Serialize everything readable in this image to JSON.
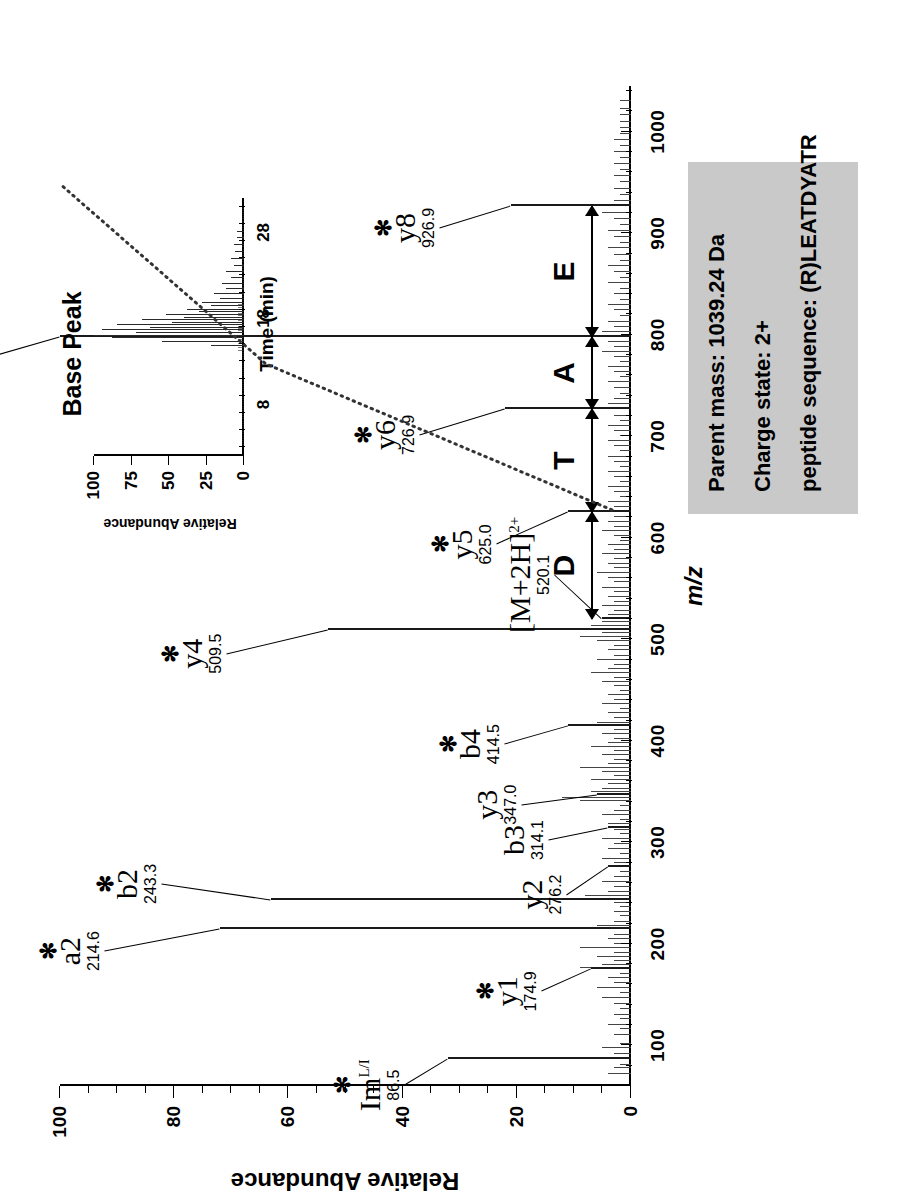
{
  "figure": {
    "info_box": {
      "parent_mass": "Parent mass: 1039.24 Da",
      "charge_state": "Charge state: 2+",
      "peptide_sequence": "peptide sequence: (R)LEATDYATR"
    },
    "inset_title": "Base Peak"
  },
  "chart_data": [
    {
      "type": "bar",
      "id": "ms-ms-spectrum",
      "title": "",
      "xlabel": "m/z",
      "ylabel": "Relative Abundance",
      "xlim": [
        60,
        1045
      ],
      "ylim": [
        0,
        100
      ],
      "grid": false,
      "legend": "none",
      "xticks": [
        100,
        200,
        300,
        400,
        500,
        600,
        700,
        800,
        900,
        1000
      ],
      "yticks": [
        0,
        20,
        40,
        60,
        80,
        100
      ],
      "x_minor_step": 20,
      "y_minor_step": 5,
      "annotated_peaks": [
        {
          "label": "Im",
          "sup": "L/I",
          "mz": "86.5",
          "x": 86.5,
          "y": 32,
          "star": true
        },
        {
          "label": "y1",
          "sup": "",
          "mz": "174.9",
          "x": 174.9,
          "y": 7,
          "star": true
        },
        {
          "label": "a2",
          "sup": "",
          "mz": "214.6",
          "x": 214.6,
          "y": 72,
          "star": true
        },
        {
          "label": "b2",
          "sup": "",
          "mz": "243.3",
          "x": 243.3,
          "y": 63,
          "star": true
        },
        {
          "label": "y2",
          "sup": "",
          "mz": "276.2",
          "x": 276.2,
          "y": 4,
          "star": false
        },
        {
          "label": "b3",
          "sup": "",
          "mz": "314.1",
          "x": 314.1,
          "y": 4,
          "star": false
        },
        {
          "label": "y3",
          "sup": "",
          "mz": "347.0",
          "x": 347.0,
          "y": 6,
          "star": false
        },
        {
          "label": "b4",
          "sup": "",
          "mz": "414.5",
          "x": 414.5,
          "y": 11,
          "star": true
        },
        {
          "label": "y4",
          "sup": "",
          "mz": "509.5",
          "x": 509.5,
          "y": 53,
          "star": true
        },
        {
          "label": "[M+2H]",
          "sup": "2+",
          "mz": "520.1",
          "x": 520.1,
          "y": 5,
          "star": false
        },
        {
          "label": "y5",
          "sup": "",
          "mz": "625.0",
          "x": 625.0,
          "y": 11,
          "star": true
        },
        {
          "label": "y6",
          "sup": "",
          "mz": "726.9",
          "x": 726.9,
          "y": 22,
          "star": true
        },
        {
          "label": "y7",
          "sup": "",
          "mz": "797.8",
          "x": 797.8,
          "y": 100,
          "star": true
        },
        {
          "label": "y8",
          "sup": "",
          "mz": "926.9",
          "x": 926.9,
          "y": 21,
          "star": true
        }
      ],
      "sequence_ladder": [
        {
          "residue": "D",
          "from_mz": 520.1,
          "to_mz": 625.0
        },
        {
          "residue": "T",
          "from_mz": 625.0,
          "to_mz": 726.9
        },
        {
          "residue": "A",
          "from_mz": 726.9,
          "to_mz": 797.8
        },
        {
          "residue": "E",
          "from_mz": 797.8,
          "to_mz": 926.9
        }
      ],
      "background_peaks": [
        [
          72,
          4
        ],
        [
          78,
          3
        ],
        [
          81,
          2
        ],
        [
          92,
          3
        ],
        [
          97,
          5
        ],
        [
          101,
          2
        ],
        [
          110,
          3
        ],
        [
          116,
          2
        ],
        [
          120,
          4
        ],
        [
          126,
          2
        ],
        [
          130,
          3
        ],
        [
          136,
          2
        ],
        [
          141,
          3
        ],
        [
          147,
          5
        ],
        [
          152,
          2
        ],
        [
          157,
          6
        ],
        [
          161,
          3
        ],
        [
          166,
          4
        ],
        [
          170,
          2
        ],
        [
          176,
          9
        ],
        [
          179,
          5
        ],
        [
          183,
          3
        ],
        [
          187,
          6
        ],
        [
          191,
          3
        ],
        [
          196,
          9
        ],
        [
          200,
          3
        ],
        [
          205,
          4
        ],
        [
          209,
          3
        ],
        [
          218,
          6
        ],
        [
          222,
          3
        ],
        [
          227,
          2
        ],
        [
          231,
          3
        ],
        [
          236,
          2
        ],
        [
          240,
          3
        ],
        [
          247,
          8
        ],
        [
          251,
          4
        ],
        [
          256,
          3
        ],
        [
          261,
          5
        ],
        [
          266,
          3
        ],
        [
          271,
          2
        ],
        [
          280,
          3
        ],
        [
          284,
          5
        ],
        [
          289,
          2
        ],
        [
          293,
          4
        ],
        [
          298,
          3
        ],
        [
          303,
          5
        ],
        [
          308,
          2
        ],
        [
          312,
          3
        ],
        [
          318,
          4
        ],
        [
          322,
          2
        ],
        [
          327,
          5
        ],
        [
          331,
          3
        ],
        [
          336,
          2
        ],
        [
          341,
          9
        ],
        [
          344,
          12
        ],
        [
          350,
          7
        ],
        [
          353,
          5
        ],
        [
          357,
          4
        ],
        [
          361,
          7
        ],
        [
          365,
          3
        ],
        [
          369,
          5
        ],
        [
          373,
          9
        ],
        [
          377,
          4
        ],
        [
          381,
          3
        ],
        [
          386,
          5
        ],
        [
          390,
          3
        ],
        [
          394,
          7
        ],
        [
          398,
          4
        ],
        [
          402,
          3
        ],
        [
          407,
          5
        ],
        [
          411,
          3
        ],
        [
          418,
          6
        ],
        [
          422,
          3
        ],
        [
          427,
          4
        ],
        [
          431,
          2
        ],
        [
          436,
          5
        ],
        [
          440,
          3
        ],
        [
          445,
          4
        ],
        [
          449,
          2
        ],
        [
          454,
          3
        ],
        [
          458,
          5
        ],
        [
          462,
          3
        ],
        [
          467,
          7
        ],
        [
          471,
          4
        ],
        [
          475,
          3
        ],
        [
          480,
          6
        ],
        [
          484,
          3
        ],
        [
          489,
          4
        ],
        [
          493,
          3
        ],
        [
          498,
          6
        ],
        [
          502,
          9
        ],
        [
          506,
          5
        ],
        [
          513,
          7
        ],
        [
          517,
          5
        ],
        [
          524,
          4
        ],
        [
          528,
          3
        ],
        [
          533,
          5
        ],
        [
          537,
          3
        ],
        [
          542,
          4
        ],
        [
          547,
          3
        ],
        [
          551,
          5
        ],
        [
          556,
          3
        ],
        [
          560,
          4
        ],
        [
          565,
          6
        ],
        [
          570,
          3
        ],
        [
          574,
          4
        ],
        [
          579,
          3
        ],
        [
          584,
          5
        ],
        [
          588,
          3
        ],
        [
          593,
          4
        ],
        [
          597,
          2
        ],
        [
          602,
          3
        ],
        [
          607,
          5
        ],
        [
          611,
          3
        ],
        [
          616,
          4
        ],
        [
          620,
          3
        ],
        [
          630,
          3
        ],
        [
          635,
          4
        ],
        [
          640,
          2
        ],
        [
          645,
          3
        ],
        [
          650,
          4
        ],
        [
          655,
          2
        ],
        [
          660,
          3
        ],
        [
          665,
          4
        ],
        [
          670,
          2
        ],
        [
          675,
          3
        ],
        [
          680,
          4
        ],
        [
          685,
          2
        ],
        [
          690,
          3
        ],
        [
          695,
          4
        ],
        [
          700,
          2
        ],
        [
          705,
          3
        ],
        [
          710,
          4
        ],
        [
          715,
          2
        ],
        [
          720,
          3
        ],
        [
          732,
          4
        ],
        [
          737,
          3
        ],
        [
          742,
          2
        ],
        [
          748,
          3
        ],
        [
          753,
          4
        ],
        [
          758,
          2
        ],
        [
          763,
          3
        ],
        [
          768,
          4
        ],
        [
          773,
          2
        ],
        [
          778,
          3
        ],
        [
          783,
          5
        ],
        [
          788,
          3
        ],
        [
          793,
          4
        ],
        [
          803,
          5
        ],
        [
          808,
          3
        ],
        [
          813,
          4
        ],
        [
          818,
          2
        ],
        [
          824,
          3
        ],
        [
          829,
          4
        ],
        [
          834,
          2
        ],
        [
          840,
          3
        ],
        [
          845,
          2
        ],
        [
          851,
          4
        ],
        [
          856,
          2
        ],
        [
          862,
          3
        ],
        [
          868,
          4
        ],
        [
          873,
          2
        ],
        [
          879,
          3
        ],
        [
          885,
          4
        ],
        [
          890,
          2
        ],
        [
          896,
          3
        ],
        [
          902,
          4
        ],
        [
          908,
          2
        ],
        [
          914,
          3
        ],
        [
          920,
          5
        ],
        [
          932,
          3
        ],
        [
          938,
          2
        ],
        [
          944,
          3
        ],
        [
          950,
          2
        ],
        [
          956,
          3
        ],
        [
          962,
          2
        ],
        [
          968,
          3
        ],
        [
          974,
          2
        ],
        [
          980,
          3
        ],
        [
          986,
          2
        ],
        [
          992,
          3
        ],
        [
          998,
          2
        ],
        [
          1004,
          2
        ],
        [
          1010,
          2
        ],
        [
          1016,
          2
        ],
        [
          1022,
          2
        ],
        [
          1030,
          2
        ]
      ]
    },
    {
      "type": "line",
      "id": "base-peak-chromatogram",
      "title": "Base Peak",
      "xlabel": "Time (min)",
      "ylabel": "Relative Abundance",
      "xlim": [
        2,
        32
      ],
      "ylim": [
        0,
        100
      ],
      "grid": false,
      "legend": "none",
      "xticks": [
        8,
        18,
        28
      ],
      "yticks": [
        0,
        25,
        50,
        75,
        100
      ],
      "peaks": [
        [
          14.8,
          22
        ],
        [
          15.3,
          55
        ],
        [
          15.7,
          88
        ],
        [
          16.0,
          100
        ],
        [
          16.3,
          72
        ],
        [
          16.6,
          95
        ],
        [
          16.9,
          63
        ],
        [
          17.2,
          85
        ],
        [
          17.5,
          48
        ],
        [
          17.8,
          68
        ],
        [
          18.1,
          40
        ],
        [
          18.4,
          52
        ],
        [
          18.7,
          30
        ],
        [
          19.0,
          38
        ],
        [
          19.4,
          22
        ],
        [
          19.8,
          28
        ],
        [
          20.3,
          16
        ],
        [
          20.8,
          20
        ],
        [
          21.4,
          12
        ],
        [
          22.0,
          15
        ],
        [
          22.7,
          9
        ],
        [
          23.4,
          12
        ],
        [
          24.1,
          7
        ],
        [
          24.9,
          9
        ],
        [
          25.7,
          6
        ],
        [
          26.5,
          7
        ],
        [
          27.3,
          5
        ],
        [
          28.1,
          5
        ]
      ]
    }
  ]
}
